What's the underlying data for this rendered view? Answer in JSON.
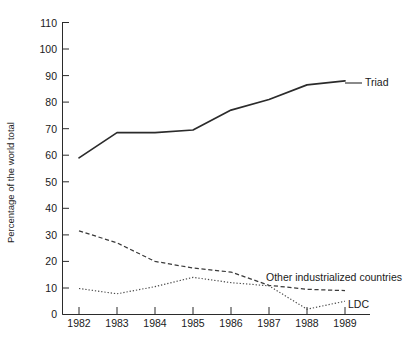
{
  "chart_data": {
    "type": "line",
    "title": "",
    "xlabel": "",
    "ylabel": "Percentage of the world total",
    "x": [
      1982,
      1983,
      1984,
      1985,
      1986,
      1987,
      1988,
      1989
    ],
    "xtick_labels": [
      "1982",
      "1983",
      "1984",
      "1985",
      "1986",
      "1987",
      "1988",
      "1989"
    ],
    "ytick_labels": [
      "0",
      "10",
      "20",
      "30",
      "40",
      "50",
      "60",
      "70",
      "80",
      "90",
      "100",
      "110"
    ],
    "ytick_values": [
      0,
      10,
      20,
      30,
      40,
      50,
      60,
      70,
      80,
      90,
      100,
      110
    ],
    "ylim": [
      0,
      110
    ],
    "xlim": [
      1982,
      1989
    ],
    "grid": false,
    "legend_position": "inline-right-annotations",
    "series": [
      {
        "name": "Triad",
        "style": "solid",
        "label_text": "Triad",
        "values": [
          59,
          68.5,
          68.5,
          69.5,
          77,
          81,
          86.5,
          88
        ]
      },
      {
        "name": "Other industrialized countries",
        "style": "dashed",
        "label_text": "Other industrialized countries",
        "values": [
          31.5,
          27,
          20,
          17.5,
          16,
          11,
          9.5,
          9
        ]
      },
      {
        "name": "LDC",
        "style": "dotted",
        "label_text": "LDC",
        "values": [
          9.8,
          7.8,
          10.5,
          14,
          12,
          10.8,
          2,
          5
        ]
      }
    ],
    "annotations": [
      {
        "text": "Triad",
        "x": 1989,
        "y": 88
      },
      {
        "text": "Other industrialized countries",
        "x": 1988,
        "y": 12
      },
      {
        "text": "LDC",
        "x": 1989,
        "y": 5
      }
    ],
    "colors": {
      "axis": "#2b2b2b",
      "triad": "#2b2b2b",
      "other_industrialized": "#3a3a3a",
      "ldc": "#4a4a4a",
      "background": "#ffffff",
      "text": "#1a1a1a"
    }
  }
}
